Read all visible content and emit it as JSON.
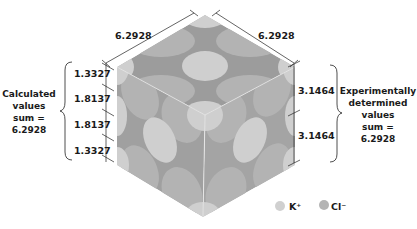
{
  "diagram": {
    "top_edges": {
      "left_label": "6.2928",
      "right_label": "6.2928"
    },
    "left_dimensions": [
      "1.3327",
      "1.8137",
      "1.8137",
      "1.3327"
    ],
    "right_dimensions": [
      "3.1464",
      "3.1464"
    ],
    "left_caption": {
      "line1": "Calculated",
      "line2": "values",
      "line3": "sum  =",
      "line4": "6.2928"
    },
    "right_caption": {
      "line1": "Experimentally",
      "line2": "determined",
      "line3": "values",
      "line4": "sum  =",
      "line5": "6.2928"
    },
    "legend": [
      {
        "label": "K⁺",
        "color": "#d0d0d0"
      },
      {
        "label": "Cl⁻",
        "color": "#b4b4b4"
      }
    ],
    "colors": {
      "background_face": "#9a9a9a",
      "k_ion": "#cfcfcf",
      "cl_ion": "#b3b3b3",
      "lines": "#222222"
    }
  }
}
